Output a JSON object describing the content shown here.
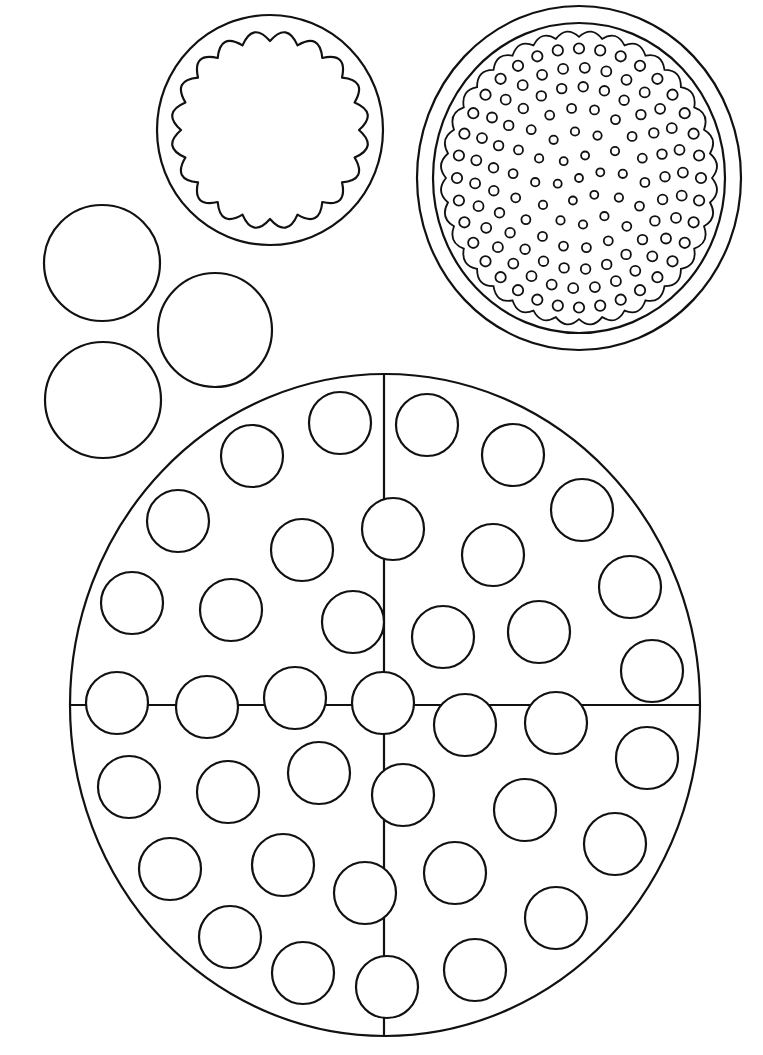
{
  "page": {
    "kind": "coloring-sheet",
    "background": "#ffffff",
    "stroke_color": "#111111"
  },
  "shapes": {
    "scalloped_circle": {
      "cx": 270,
      "cy": 130,
      "rx": 113,
      "ry": 115,
      "inner_r": 97,
      "scallops": 20
    },
    "dotted_circle": {
      "cx": 579,
      "cy": 178,
      "rx": 162,
      "ry": 172,
      "inner_rx": 146,
      "inner_ry": 155,
      "scallop_r": 137,
      "scallops": 36,
      "rings": [
        {
          "r": 122,
          "count": 36,
          "dot": 5.2
        },
        {
          "r": 104,
          "count": 30,
          "dot": 5.0
        },
        {
          "r": 86,
          "count": 25,
          "dot": 4.8
        },
        {
          "r": 66,
          "count": 18,
          "dot": 4.5
        },
        {
          "r": 44,
          "count": 12,
          "dot": 4.2
        },
        {
          "r": 22,
          "count": 6,
          "dot": 4.0
        },
        {
          "r": 0,
          "count": 1,
          "dot": 4.0
        }
      ]
    },
    "small_circles": [
      {
        "cx": 102,
        "cy": 263,
        "r": 58
      },
      {
        "cx": 215,
        "cy": 330,
        "r": 57
      },
      {
        "cx": 103,
        "cy": 400,
        "r": 58
      }
    ],
    "pizza": {
      "cx": 385,
      "cy": 705,
      "rx": 315,
      "ry": 331,
      "vertical_x": 384,
      "horizontal_y": 705,
      "dot_r": 31,
      "dots": [
        [
          340,
          423
        ],
        [
          252,
          456
        ],
        [
          178,
          521
        ],
        [
          302,
          550
        ],
        [
          132,
          603
        ],
        [
          231,
          610
        ],
        [
          353,
          622
        ],
        [
          427,
          425
        ],
        [
          513,
          455
        ],
        [
          582,
          510
        ],
        [
          393,
          529
        ],
        [
          493,
          555
        ],
        [
          630,
          587
        ],
        [
          443,
          637
        ],
        [
          539,
          632
        ],
        [
          652,
          671
        ],
        [
          117,
          703
        ],
        [
          207,
          707
        ],
        [
          295,
          698
        ],
        [
          383,
          703
        ],
        [
          465,
          725
        ],
        [
          556,
          723
        ],
        [
          129,
          787
        ],
        [
          228,
          792
        ],
        [
          319,
          773
        ],
        [
          170,
          869
        ],
        [
          283,
          865
        ],
        [
          230,
          937
        ],
        [
          303,
          973
        ],
        [
          365,
          893
        ],
        [
          647,
          758
        ],
        [
          403,
          795
        ],
        [
          525,
          810
        ],
        [
          615,
          844
        ],
        [
          455,
          873
        ],
        [
          556,
          918
        ],
        [
          475,
          970
        ],
        [
          387,
          987
        ]
      ]
    }
  }
}
